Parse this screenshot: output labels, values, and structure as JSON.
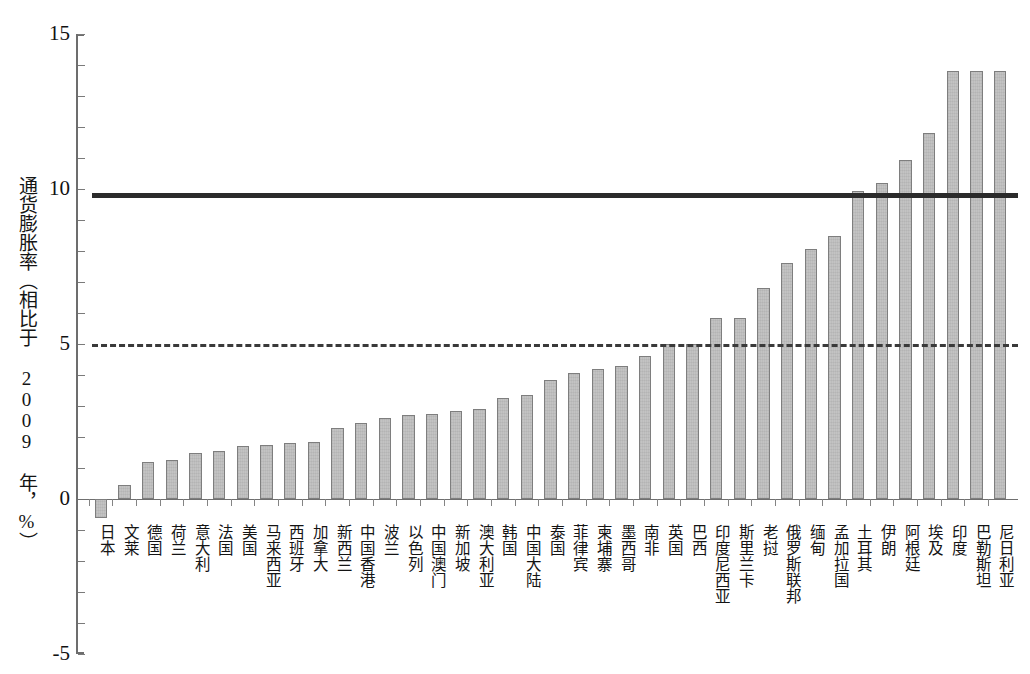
{
  "chart_data": {
    "type": "bar",
    "title": "",
    "xlabel": "",
    "ylabel": "通货膨胀率（相比于 2009 年，%）",
    "ylim": [
      -5,
      15
    ],
    "ytick_labels": [
      "15",
      "10",
      "5",
      "0",
      "-5"
    ],
    "ytick_values": [
      15,
      10,
      5,
      0,
      -5
    ],
    "yminor_step": 1,
    "grid": false,
    "legend": "none",
    "bar_color": "#c3c3c3",
    "bar_edge_color": "#7e7e7e",
    "categories": [
      "日本",
      "文莱",
      "德国",
      "荷兰",
      "意大利",
      "法国",
      "美国",
      "马来西亚",
      "西班牙",
      "加拿大",
      "新西兰",
      "中国香港",
      "波兰",
      "以色列",
      "中国澳门",
      "新加坡",
      "澳大利亚",
      "韩国",
      "中国大陆",
      "泰国",
      "菲律宾",
      "柬埔寨",
      "墨西哥",
      "南非",
      "英国",
      "巴西",
      "印度尼西亚",
      "斯里兰卡",
      "老挝",
      "俄罗斯联邦",
      "缅甸",
      "孟加拉国",
      "土耳其",
      "伊朗",
      "阿根廷",
      "埃及",
      "印度",
      "巴勒斯坦",
      "尼日利亚"
    ],
    "values": [
      -0.6,
      0.45,
      1.2,
      1.25,
      1.5,
      1.55,
      1.7,
      1.75,
      1.8,
      1.85,
      2.3,
      2.45,
      2.6,
      2.7,
      2.75,
      2.85,
      2.9,
      3.25,
      3.35,
      3.85,
      4.05,
      4.2,
      4.3,
      4.6,
      5.0,
      5.0,
      5.85,
      5.85,
      6.8,
      7.6,
      8.05,
      8.5,
      9.95,
      10.2,
      10.95,
      11.8,
      13.8,
      13.8,
      13.8
    ],
    "annotations": [
      {
        "name": "solid-reference-line",
        "style": "solid",
        "value": 9.8,
        "color": "#2b2b2b"
      },
      {
        "name": "dashed-reference-line",
        "style": "dashed",
        "value": 5.0,
        "color": "#3a3a3a"
      }
    ]
  }
}
